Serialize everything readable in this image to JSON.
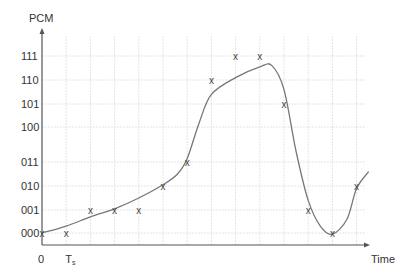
{
  "chart_data": {
    "type": "line",
    "title": "",
    "xlabel": "Time",
    "ylabel": "PCM",
    "x_tick_labels": [
      "0",
      "Ts"
    ],
    "y_levels": [
      "000",
      "001",
      "010",
      "011",
      "100",
      "101",
      "110",
      "111"
    ],
    "grid": true,
    "sample_marker": "x",
    "samples": {
      "t": [
        0,
        1,
        2,
        3,
        4,
        5,
        6,
        7,
        8,
        9,
        10,
        11,
        12,
        13
      ],
      "level": [
        "000",
        "000",
        "001",
        "001",
        "001",
        "010",
        "011",
        "110",
        "111",
        "111",
        "101",
        "001",
        "000",
        "010"
      ]
    },
    "curve": {
      "description": "continuous analog signal",
      "t": [
        0,
        1,
        2,
        3,
        4,
        5,
        5.6,
        6,
        6.5,
        7,
        8,
        9,
        9.5,
        10,
        10.5,
        11,
        11.5,
        12,
        12.6,
        13,
        13.5
      ],
      "value": [
        0.0,
        0.3,
        0.7,
        1.05,
        1.5,
        2.05,
        2.5,
        3.1,
        4.2,
        5.4,
        6.1,
        6.55,
        6.6,
        5.6,
        3.3,
        1.4,
        0.3,
        -0.05,
        0.6,
        1.9,
        2.6
      ]
    },
    "line_color": "#777777",
    "axis_color": "#555555",
    "grid_color": "#e4e4e4"
  }
}
